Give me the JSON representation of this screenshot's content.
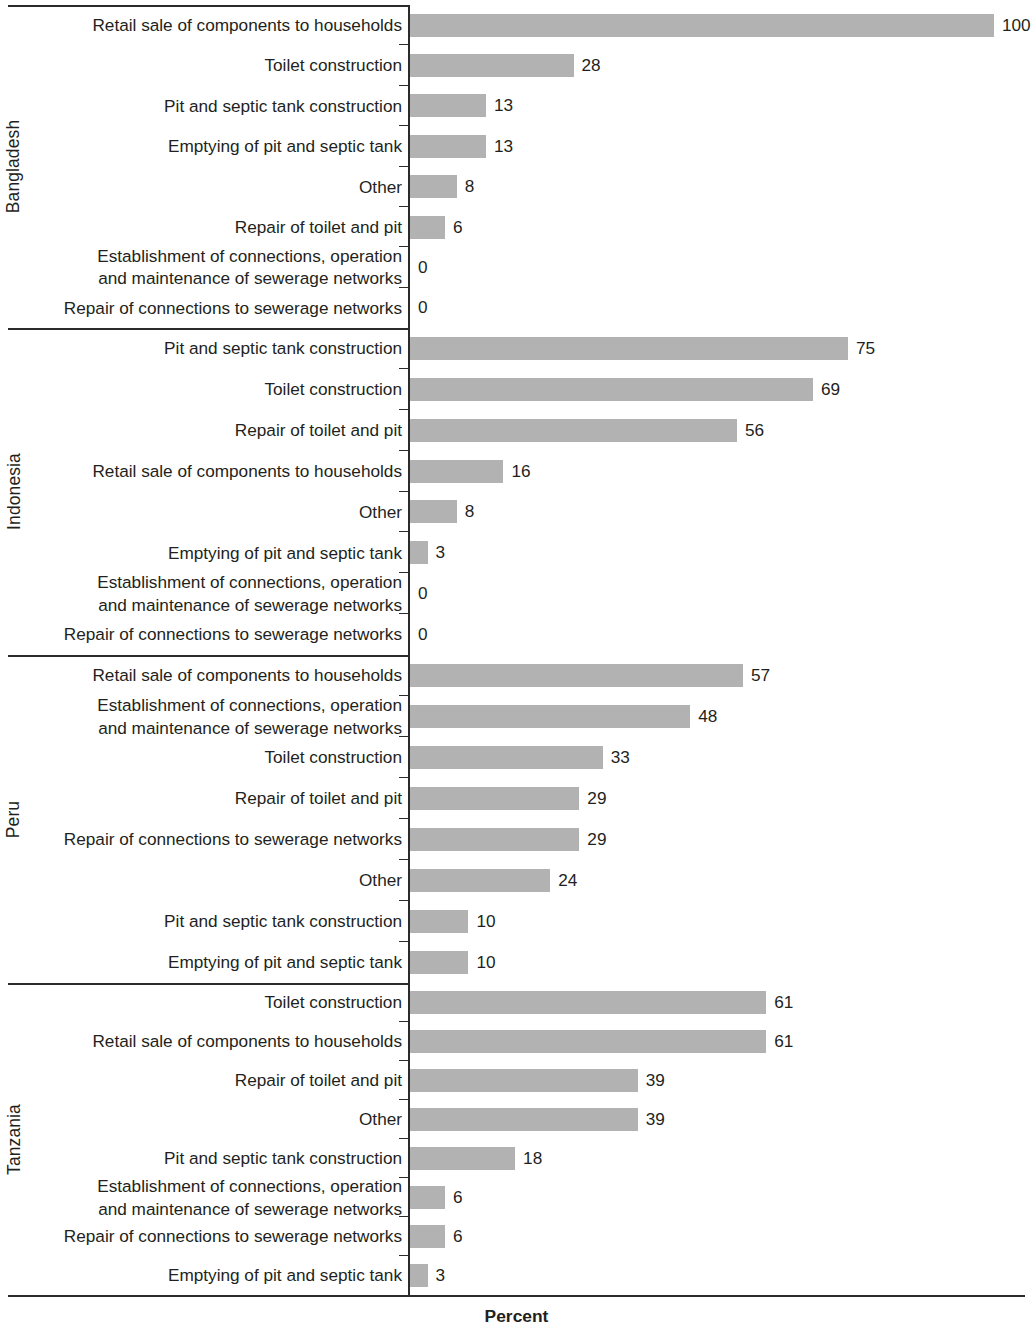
{
  "chart_data": {
    "type": "bar",
    "title": "",
    "subtitle": "",
    "xlabel": "Percent",
    "ylabel": "",
    "orientation": "horizontal",
    "grid": false,
    "legend": null,
    "xlim": [
      0,
      100
    ],
    "value_suffix": "",
    "groups": [
      {
        "name": "Bangladesh",
        "categories": [
          "Retail sale of components to households",
          "Toilet construction",
          "Pit and septic tank construction",
          "Emptying of pit and septic tank",
          "Other",
          "Repair of toilet and pit",
          "Establishment of connections, operation and maintenance of sewerage networks",
          "Repair of connections to sewerage networks"
        ],
        "category_lines": [
          [
            "Retail sale of components to households"
          ],
          [
            "Toilet construction"
          ],
          [
            "Pit and septic tank construction"
          ],
          [
            "Emptying of pit and septic tank"
          ],
          [
            "Other"
          ],
          [
            "Repair of toilet and pit"
          ],
          [
            "Establishment of connections, operation",
            "and maintenance of sewerage networks"
          ],
          [
            "Repair of connections to sewerage networks"
          ]
        ],
        "values": [
          100,
          28,
          13,
          13,
          8,
          6,
          0,
          0
        ]
      },
      {
        "name": "Indonesia",
        "categories": [
          "Pit and septic tank construction",
          "Toilet construction",
          "Repair of toilet and pit",
          "Retail sale of components to households",
          "Other",
          "Emptying of pit and septic tank",
          "Establishment of connections, operation and maintenance of sewerage networks",
          "Repair of connections to sewerage networks"
        ],
        "category_lines": [
          [
            "Pit and septic tank construction"
          ],
          [
            "Toilet construction"
          ],
          [
            "Repair of toilet and pit"
          ],
          [
            "Retail sale of components to households"
          ],
          [
            "Other"
          ],
          [
            "Emptying of pit and septic tank"
          ],
          [
            "Establishment of connections, operation",
            "and maintenance of sewerage networks"
          ],
          [
            "Repair of connections to sewerage networks"
          ]
        ],
        "values": [
          75,
          69,
          56,
          16,
          8,
          3,
          0,
          0
        ]
      },
      {
        "name": "Peru",
        "categories": [
          "Retail sale of components to households",
          "Establishment of connections, operation and maintenance of sewerage networks",
          "Toilet construction",
          "Repair of toilet and pit",
          "Repair of connections to sewerage networks",
          "Other",
          "Pit and septic tank construction",
          "Emptying of pit and septic tank"
        ],
        "category_lines": [
          [
            "Retail sale of components to households"
          ],
          [
            "Establishment of connections, operation",
            "and maintenance of sewerage networks"
          ],
          [
            "Toilet construction"
          ],
          [
            "Repair of toilet and pit"
          ],
          [
            "Repair of connections to sewerage networks"
          ],
          [
            "Other"
          ],
          [
            "Pit and septic tank construction"
          ],
          [
            "Emptying of pit and septic tank"
          ]
        ],
        "values": [
          57,
          48,
          33,
          29,
          29,
          24,
          10,
          10
        ]
      },
      {
        "name": "Tanzania",
        "categories": [
          "Toilet construction",
          "Retail sale of components to households",
          "Repair of toilet and pit",
          "Other",
          "Pit and septic tank construction",
          "Establishment of connections, operation and maintenance of sewerage networks",
          "Repair of connections to sewerage networks",
          "Emptying of pit and septic tank"
        ],
        "category_lines": [
          [
            "Toilet construction"
          ],
          [
            "Retail sale of components to households"
          ],
          [
            "Repair of toilet and pit"
          ],
          [
            "Other"
          ],
          [
            "Pit and septic tank construction"
          ],
          [
            "Establishment of connections, operation",
            "and maintenance of sewerage networks"
          ],
          [
            "Repair of connections to sewerage networks"
          ],
          [
            "Emptying of pit and septic tank"
          ]
        ],
        "values": [
          61,
          61,
          39,
          39,
          18,
          6,
          6,
          3
        ]
      }
    ]
  },
  "style": {
    "bar_color": "#b2b2b2",
    "axis_color": "#2b2b2b",
    "text_color": "#231f20",
    "background": "#ffffff"
  },
  "layout": {
    "axis_x": 408,
    "px_per_unit": 5.84,
    "group_tops": [
      5,
      328,
      655,
      983
    ],
    "group_bottoms": [
      328,
      655,
      983,
      1295
    ]
  }
}
